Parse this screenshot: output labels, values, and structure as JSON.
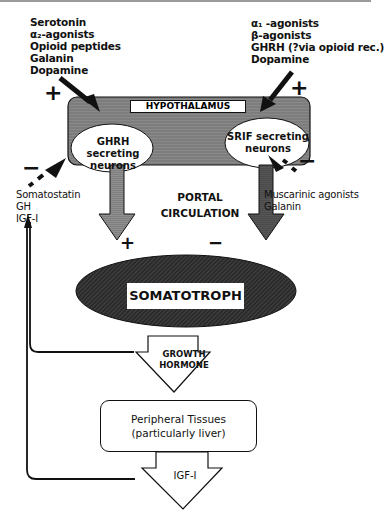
{
  "diagram": {
    "hypothalamus": {
      "label": "HYPOTHALAMUS",
      "fill_color": "#8a8a8a",
      "ghrh_neurons": {
        "line1": "GHRH secreting",
        "line2": "neurons"
      },
      "srif_neurons": {
        "line1": "SRIF secreting",
        "line2": "neurons"
      }
    },
    "ghrh_stimulators": {
      "sign": "+",
      "items": [
        "Serotonin",
        "α₂-agonists",
        "Opioid peptides",
        "Galanin",
        "Dopamine"
      ]
    },
    "ghrh_inhibitors": {
      "sign": "−",
      "items": [
        "Somatostatin",
        "GH",
        "IGF-I"
      ]
    },
    "srif_stimulators": {
      "sign": "+",
      "items": [
        "α₁ -agonists",
        "β-agonists",
        "GHRH (?via opioid rec.)",
        "Dopamine"
      ]
    },
    "srif_inhibitors": {
      "sign": "−",
      "items": [
        "Muscarinic agonists",
        "Galanin"
      ]
    },
    "portal": {
      "line1": "PORTAL",
      "line2": "CIRCULATION"
    },
    "ghrh_effect_sign": "+",
    "srif_effect_sign": "−",
    "somatotroph": {
      "label": "SOMATOTROPH",
      "fill_color": "#2e2e2e"
    },
    "growth_hormone": {
      "line1": "GROWTH",
      "line2": "HORMONE"
    },
    "peripheral": {
      "line1": "Peripheral Tissues",
      "line2": "(particularly liver)"
    },
    "igf": {
      "label": "IGF-I"
    }
  }
}
